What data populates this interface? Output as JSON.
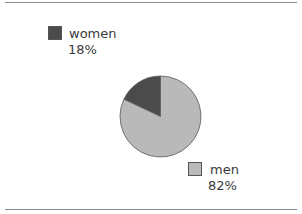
{
  "chart_data": {
    "type": "pie",
    "title": "",
    "categories": [
      "women",
      "men"
    ],
    "values": [
      18,
      82
    ],
    "unit": "%",
    "colors": [
      "#4b4b4b",
      "#b9b9b9"
    ],
    "start_angle_deg": 0,
    "direction": "counterclockwise-from-top for first slice",
    "legend_position": "labels placed beside chart (women top-left, men bottom-right)"
  },
  "legend": {
    "women": {
      "label": "women",
      "value": "18%",
      "color": "#4b4b4b"
    },
    "men": {
      "label": "men",
      "value": "82%",
      "color": "#b9b9b9"
    }
  },
  "colors": {
    "rule": "#8a8a8a",
    "slice_stroke": "#5a5a5a"
  }
}
